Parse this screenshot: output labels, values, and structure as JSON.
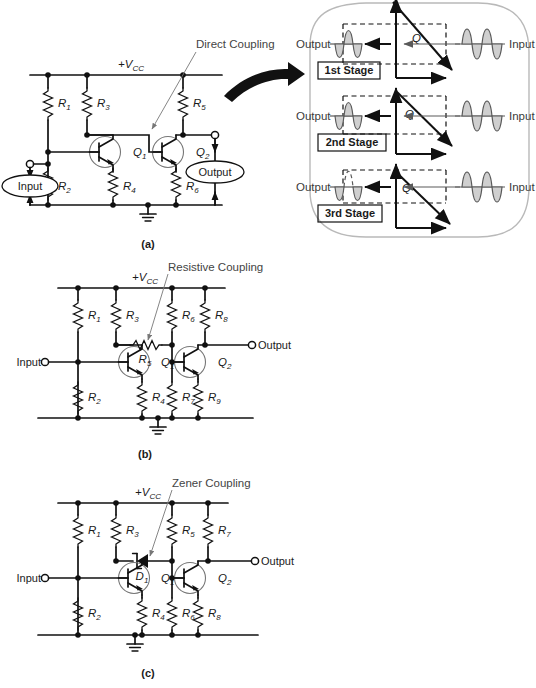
{
  "figure": {
    "panels": [
      {
        "tag": "(a)",
        "callout": "Direct Coupling",
        "supply": "+V",
        "supply_sub": "CC",
        "input_label": "Input",
        "output_label": "Output",
        "transistors": [
          {
            "label": "Q",
            "sub": "1"
          },
          {
            "label": "Q",
            "sub": "2"
          }
        ],
        "resistors": [
          {
            "label": "R",
            "sub": "1"
          },
          {
            "label": "R",
            "sub": "2"
          },
          {
            "label": "R",
            "sub": "3"
          },
          {
            "label": "R",
            "sub": "4"
          },
          {
            "label": "R",
            "sub": "5"
          },
          {
            "label": "R",
            "sub": "6"
          }
        ]
      },
      {
        "tag": "(b)",
        "callout": "Resistive Coupling",
        "supply": "+V",
        "supply_sub": "CC",
        "input_label": "Input",
        "output_label": "Output",
        "transistors": [
          {
            "label": "Q",
            "sub": "1"
          },
          {
            "label": "Q",
            "sub": "2"
          }
        ],
        "resistors": [
          {
            "label": "R",
            "sub": "1"
          },
          {
            "label": "R",
            "sub": "2"
          },
          {
            "label": "R",
            "sub": "3"
          },
          {
            "label": "R",
            "sub": "4"
          },
          {
            "label": "R",
            "sub": "5"
          },
          {
            "label": "R",
            "sub": "6"
          },
          {
            "label": "R",
            "sub": "7"
          },
          {
            "label": "R",
            "sub": "8"
          },
          {
            "label": "R",
            "sub": "9"
          }
        ]
      },
      {
        "tag": "(c)",
        "callout": "Zener Coupling",
        "supply": "+V",
        "supply_sub": "CC",
        "input_label": "Input",
        "output_label": "Output",
        "diode": {
          "label": "D",
          "sub": "1"
        },
        "transistors": [
          {
            "label": "Q",
            "sub": "1"
          },
          {
            "label": "Q",
            "sub": "2"
          }
        ],
        "resistors": [
          {
            "label": "R",
            "sub": "1"
          },
          {
            "label": "R",
            "sub": "2"
          },
          {
            "label": "R",
            "sub": "3"
          },
          {
            "label": "R",
            "sub": "4"
          },
          {
            "label": "R",
            "sub": "5"
          },
          {
            "label": "R",
            "sub": "6"
          },
          {
            "label": "R",
            "sub": "7"
          },
          {
            "label": "R",
            "sub": "8"
          }
        ]
      }
    ]
  },
  "detail_panel": {
    "stages": [
      {
        "name": "1st Stage",
        "output_label": "Output",
        "input_label": "Input",
        "q_label": "Q",
        "clipped": false,
        "q_position": "center"
      },
      {
        "name": "2nd Stage",
        "output_label": "Output",
        "input_label": "Input",
        "q_label": "Q",
        "clipped": false,
        "q_position": "upper"
      },
      {
        "name": "3rd Stage",
        "output_label": "Output",
        "input_label": "Input",
        "q_label": "Q",
        "clipped": true,
        "q_position": "top"
      }
    ]
  },
  "colors": {
    "wire": "#111111",
    "panel_border": "#b9b9b9",
    "wave_fill": "#cfcfcf",
    "wave_stroke": "#5a5a5a",
    "callout_text": "#444444"
  }
}
